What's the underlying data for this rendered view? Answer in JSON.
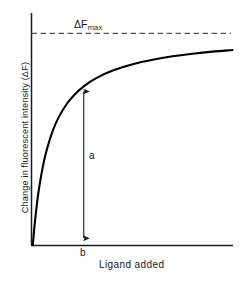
{
  "figure": {
    "labels": {
      "y_axis": "Change in fluorescent intensity (ΔF)",
      "x_axis": "Ligand added",
      "asymptote_symbol": "ΔF",
      "asymptote_subscript": "max",
      "segment_a": "a",
      "segment_b": "b"
    },
    "colors": {
      "background": "#ffffff",
      "curve": "#000000",
      "axis": "#1a1a1a",
      "asymptote": "#555555",
      "arrow": "#1a1a1a",
      "text": "#1a1a1a"
    }
  },
  "chart_data": {
    "type": "line",
    "title": "",
    "subtitle": "",
    "xlabel": "Ligand added",
    "ylabel": "Change in fluorescent intensity (ΔF)",
    "xlim": [
      0,
      1
    ],
    "ylim": [
      0,
      1.08
    ],
    "grid": false,
    "legend": null,
    "axis_ticks": {
      "x": [],
      "y": []
    },
    "curve_model": "rectangular hyperbola: dF = dFmax * x / (Kd + x)",
    "curve_params": {
      "dFmax": 1.0,
      "Kd": 0.085
    },
    "series": [
      {
        "name": "binding isotherm",
        "x": [
          0.0,
          0.01,
          0.02,
          0.03,
          0.05,
          0.07,
          0.1,
          0.13,
          0.17,
          0.21,
          0.26,
          0.32,
          0.4,
          0.5,
          0.6,
          0.7,
          0.8,
          0.9,
          1.0
        ],
        "y": [
          0.0,
          0.105,
          0.19,
          0.261,
          0.37,
          0.451,
          0.541,
          0.605,
          0.667,
          0.712,
          0.754,
          0.79,
          0.825,
          0.855,
          0.876,
          0.892,
          0.904,
          0.914,
          0.922
        ]
      }
    ],
    "annotations": [
      {
        "name": "asymptote",
        "type": "horizontal-dashed-line",
        "y": 1.0,
        "label": "ΔFmax",
        "label_x": 0.2,
        "label_y": 0.95
      },
      {
        "name": "segment-a",
        "type": "double-headed-vertical-arrow",
        "x": 0.255,
        "y_from": 0.0,
        "y_to": 0.754,
        "label": "a",
        "label_x": 0.29,
        "label_y": 0.38
      },
      {
        "name": "segment-b",
        "type": "x-axis-position-marker",
        "x": 0.255,
        "label": "b"
      }
    ]
  }
}
